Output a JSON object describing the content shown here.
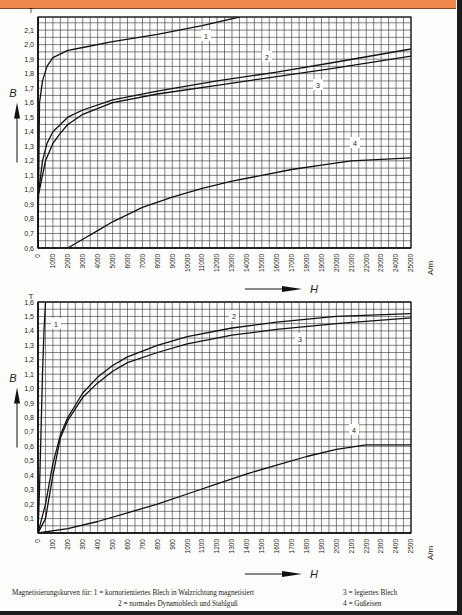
{
  "banner": {
    "color": "#f0884e"
  },
  "chart_data": [
    {
      "type": "line",
      "title": "",
      "xlabel": "H",
      "ylabel": "B",
      "x_unit": "A/m",
      "y_unit": "T",
      "xlim": [
        0,
        25000
      ],
      "ylim": [
        0.6,
        2.2
      ],
      "grid": true,
      "x_ticks": [
        "0",
        "1000",
        "2000",
        "3000",
        "4000",
        "5000",
        "6000",
        "7000",
        "8000",
        "9000",
        "10000",
        "11000",
        "12000",
        "13000",
        "14000",
        "15000",
        "16000",
        "17000",
        "18000",
        "19000",
        "20000",
        "21000",
        "22000",
        "23000",
        "24000",
        "25000"
      ],
      "y_ticks": [
        "0,6",
        "0,7",
        "0,8",
        "0,9",
        "1,0",
        "1,1",
        "1,2",
        "1,3",
        "1,4",
        "1,5",
        "1,6",
        "1,7",
        "1,8",
        "1,9",
        "2,0",
        "2,1"
      ],
      "series": [
        {
          "name": "1",
          "x": [
            0,
            100,
            300,
            600,
            1000,
            2000,
            3000,
            5000,
            8000,
            11000,
            13500
          ],
          "y": [
            0.6,
            1.6,
            1.75,
            1.85,
            1.91,
            1.96,
            1.98,
            2.02,
            2.07,
            2.13,
            2.19
          ]
        },
        {
          "name": "2",
          "x": [
            0,
            300,
            600,
            1000,
            2000,
            3000,
            5000,
            8000,
            12000,
            16000,
            20000,
            25000
          ],
          "y": [
            0.95,
            1.2,
            1.32,
            1.4,
            1.5,
            1.55,
            1.62,
            1.68,
            1.75,
            1.81,
            1.88,
            1.97
          ]
        },
        {
          "name": "3",
          "x": [
            0,
            500,
            1000,
            1500,
            2000,
            3000,
            5000,
            8000,
            12000,
            16000,
            20000,
            25000
          ],
          "y": [
            0.95,
            1.2,
            1.32,
            1.39,
            1.45,
            1.52,
            1.6,
            1.66,
            1.72,
            1.78,
            1.84,
            1.92
          ]
        },
        {
          "name": "4",
          "x": [
            2000,
            3000,
            4000,
            5000,
            7000,
            9000,
            11000,
            13000,
            15000,
            17000,
            19000,
            21000,
            25000
          ],
          "y": [
            0.6,
            0.66,
            0.72,
            0.78,
            0.88,
            0.95,
            1.01,
            1.06,
            1.1,
            1.14,
            1.17,
            1.2,
            1.22
          ]
        }
      ],
      "annotations": [
        "1",
        "2",
        "3",
        "4"
      ]
    },
    {
      "type": "line",
      "title": "",
      "xlabel": "H",
      "ylabel": "B",
      "x_unit": "A/m",
      "y_unit": "T",
      "xlim": [
        0,
        2500
      ],
      "ylim": [
        0,
        1.6
      ],
      "grid": true,
      "x_ticks": [
        "0",
        "100",
        "200",
        "300",
        "400",
        "500",
        "600",
        "700",
        "800",
        "900",
        "1000",
        "1100",
        "1200",
        "1300",
        "1400",
        "1500",
        "1600",
        "1700",
        "1800",
        "1900",
        "2000",
        "2100",
        "2200",
        "2300",
        "2400",
        "2500"
      ],
      "y_ticks": [
        "0,1",
        "0,2",
        "0,3",
        "0,4",
        "0,5",
        "0,6",
        "0,7",
        "0,8",
        "0,9",
        "1,0",
        "1,1",
        "1,2",
        "1,3",
        "1,4",
        "1,5",
        "1,6"
      ],
      "series": [
        {
          "name": "1",
          "x": [
            0,
            10,
            20,
            30,
            40,
            50
          ],
          "y": [
            0,
            0.3,
            0.7,
            1.1,
            1.4,
            1.6
          ]
        },
        {
          "name": "2",
          "x": [
            0,
            50,
            100,
            150,
            200,
            300,
            400,
            500,
            600,
            800,
            1000,
            1300,
            1600,
            2000,
            2500
          ],
          "y": [
            0,
            0.2,
            0.48,
            0.68,
            0.8,
            0.97,
            1.08,
            1.16,
            1.22,
            1.3,
            1.36,
            1.42,
            1.46,
            1.5,
            1.52
          ]
        },
        {
          "name": "3",
          "x": [
            0,
            50,
            100,
            150,
            200,
            300,
            400,
            500,
            600,
            800,
            1000,
            1300,
            1600,
            2000,
            2500
          ],
          "y": [
            0,
            0.1,
            0.4,
            0.66,
            0.78,
            0.94,
            1.04,
            1.12,
            1.18,
            1.25,
            1.31,
            1.37,
            1.41,
            1.45,
            1.49
          ]
        },
        {
          "name": "4",
          "x": [
            0,
            200,
            400,
            600,
            800,
            1000,
            1200,
            1400,
            1600,
            1800,
            2000,
            2200,
            2500
          ],
          "y": [
            0,
            0.03,
            0.08,
            0.14,
            0.2,
            0.27,
            0.34,
            0.41,
            0.47,
            0.53,
            0.58,
            0.61,
            0.61
          ]
        }
      ],
      "annotations": [
        "1",
        "2",
        "3",
        "4"
      ]
    }
  ],
  "axis": {
    "x_unit": "A/m",
    "y_unit": "T",
    "x_symbol": "H",
    "y_symbol": "B"
  },
  "caption": {
    "intro": "Magnetisierungskurven für: 1 = kornorientiertes Blech in Walzrichtung magnetisiert",
    "item2": "2 = normales Dynamoblech und Stahlguß",
    "item3": "3 = legiertes Blech",
    "item4": "4 = Gußeisen"
  }
}
